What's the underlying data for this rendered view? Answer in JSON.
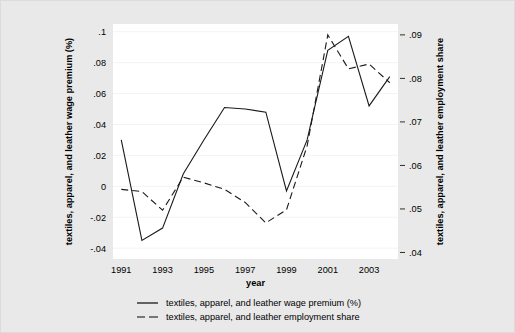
{
  "figure": {
    "background_color": "#e9e9e9",
    "plot_background_color": "#ffffff",
    "line_color": "#1a1a1a",
    "gridline_color": "#f2f2f2"
  },
  "chart_data": {
    "type": "line",
    "title": "",
    "xlabel": "year",
    "ylabel": "textiles, apparel, and leather wage premium (%)",
    "y2label": "textiles, apparel, and leather employment share",
    "x": [
      1991,
      1992,
      1993,
      1994,
      1995,
      1996,
      1997,
      1998,
      1999,
      2000,
      2001,
      2002,
      2003,
      2004
    ],
    "xlim": [
      1990.6,
      2004.4
    ],
    "xticks": [
      1991,
      1993,
      1995,
      1997,
      1999,
      2001,
      2003
    ],
    "xtick_labels": [
      "1991",
      "1993",
      "1995",
      "1997",
      "1999",
      "2001",
      "2003"
    ],
    "ylim": [
      -0.047,
      0.105
    ],
    "yticks": [
      -0.04,
      -0.02,
      0,
      0.02,
      0.04,
      0.06,
      0.08,
      0.1
    ],
    "ytick_labels": [
      "-.04",
      "-.02",
      "0",
      ".02",
      ".04",
      ".06",
      ".08",
      ".1"
    ],
    "y2lim": [
      0.0385,
      0.0925
    ],
    "y2ticks": [
      0.04,
      0.05,
      0.06,
      0.07,
      0.08,
      0.09
    ],
    "y2tick_labels": [
      ".04",
      ".05",
      ".06",
      ".07",
      ".08",
      ".09"
    ],
    "grid": true,
    "legend_position": "bottom",
    "series": [
      {
        "name": "textiles, apparel, and leather wage premium (%)",
        "axis": "left",
        "style": "solid",
        "values": [
          0.03,
          -0.035,
          -0.027,
          0.008,
          0.03,
          0.051,
          0.05,
          0.048,
          -0.003,
          0.03,
          0.088,
          0.097,
          0.052,
          0.071
        ]
      },
      {
        "name": "textiles, apparel, and leather employment share",
        "axis": "right",
        "style": "dashed",
        "values": [
          0.0545,
          0.054,
          0.0497,
          0.0573,
          0.056,
          0.0545,
          0.0515,
          0.0468,
          0.0498,
          0.0645,
          0.09,
          0.0822,
          0.0833,
          0.079
        ]
      }
    ]
  },
  "legend": {
    "items": [
      {
        "label": "textiles, apparel, and leather wage premium (%)",
        "style": "solid"
      },
      {
        "label": "textiles, apparel, and leather employment share",
        "style": "dashed"
      }
    ]
  }
}
